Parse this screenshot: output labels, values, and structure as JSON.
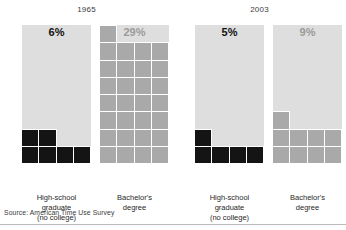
{
  "chart_data": {
    "type": "bar",
    "title": "",
    "subtitle": "",
    "xlabel": "",
    "ylabel": "",
    "ylim": [
      0,
      100
    ],
    "grid": false,
    "legend_position": "none",
    "note": "Waffle/grid bars: each bar is a 4-column grid filled from the bottom, one cell per percentage point, against a light track representing 100%.",
    "cells_per_row": 4,
    "unit": "percent",
    "categories": [
      "High-school graduate (no college)",
      "Bachelor's degree"
    ],
    "panels": [
      {
        "year": "1965",
        "columns": [
          {
            "category": "High-school graduate (no college)",
            "value": 6,
            "value_label": "6%",
            "tone": "dark"
          },
          {
            "category": "Bachelor's degree",
            "value": 29,
            "value_label": "29%",
            "tone": "gray"
          }
        ]
      },
      {
        "year": "2003",
        "columns": [
          {
            "category": "High-school graduate (no college)",
            "value": 5,
            "value_label": "5%",
            "tone": "dark"
          },
          {
            "category": "Bachelor's degree",
            "value": 9,
            "value_label": "9%",
            "tone": "gray"
          }
        ]
      }
    ],
    "series": [
      {
        "name": "1965",
        "values": [
          6,
          29
        ]
      },
      {
        "name": "2003",
        "values": [
          5,
          9
        ]
      }
    ]
  },
  "panels": [
    {
      "year": "1965",
      "columns": [
        {
          "value_label": "6%",
          "tone": "dark",
          "label_lines": [
            "High-school",
            "graduate",
            "(no college)"
          ]
        },
        {
          "value_label": "29%",
          "tone": "gray",
          "label_lines": [
            "Bachelor's",
            "degree"
          ]
        }
      ]
    },
    {
      "year": "2003",
      "columns": [
        {
          "value_label": "5%",
          "tone": "dark",
          "label_lines": [
            "High-school",
            "graduate",
            "(no college)"
          ]
        },
        {
          "value_label": "9%",
          "tone": "gray",
          "label_lines": [
            "Bachelor's",
            "degree"
          ]
        }
      ]
    }
  ],
  "footer": {
    "source": "Source: American Time Use Survey"
  },
  "colors": {
    "dark": "#141414",
    "gray": "#a9a9a9",
    "track": "#dedede",
    "gridline": "#ffffff",
    "background": "#ffffff",
    "rule": "#b9b9b9"
  }
}
